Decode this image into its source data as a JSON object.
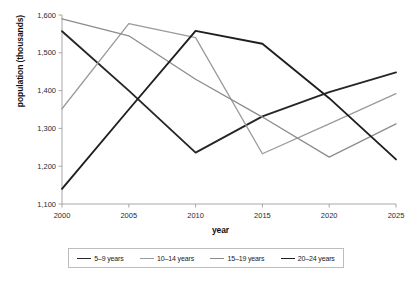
{
  "chart_data": {
    "type": "line",
    "title": "",
    "xlabel": "year",
    "ylabel": "population (thousands)",
    "x": [
      2000,
      2005,
      2010,
      2015,
      2020,
      2025
    ],
    "xtick_labels": [
      "2000",
      "2005",
      "2010",
      "2015",
      "2020",
      "2025"
    ],
    "ytick_labels": [
      "1,100",
      "1,200",
      "1,300",
      "1,400",
      "1,500",
      "1,600"
    ],
    "ytick_values": [
      1100,
      1200,
      1300,
      1400,
      1500,
      1600
    ],
    "ylim": [
      1100,
      1600
    ],
    "xlim": [
      2000,
      2025
    ],
    "grid": false,
    "legend_position": "bottom",
    "series": [
      {
        "name": "5–9 years",
        "color": "#262626",
        "width": 1.9,
        "values": [
          1557,
          1400,
          1236,
          1332,
          1396,
          1448
        ]
      },
      {
        "name": "10–14 years",
        "color": "#9a9a9a",
        "width": 1.3,
        "values": [
          1352,
          1577,
          1540,
          1233,
          1312,
          1392
        ]
      },
      {
        "name": "15–19 years",
        "color": "#8c8c8c",
        "width": 1.3,
        "values": [
          1590,
          1545,
          1430,
          1330,
          1224,
          1312
        ]
      },
      {
        "name": "20–24 years",
        "color": "#1f1f1f",
        "width": 1.9,
        "values": [
          1140,
          1350,
          1558,
          1524,
          1380,
          1218
        ]
      }
    ]
  },
  "axis_color": "#9d9d9d",
  "legend": {
    "entries": [
      {
        "label": "5–9 years",
        "color": "#262626",
        "width": 1.9
      },
      {
        "label": "10–14 years",
        "color": "#9a9a9a",
        "width": 1.3
      },
      {
        "label": "15–19 years",
        "color": "#8c8c8c",
        "width": 1.3
      },
      {
        "label": "20–24 years",
        "color": "#1f1f1f",
        "width": 1.9
      }
    ]
  }
}
